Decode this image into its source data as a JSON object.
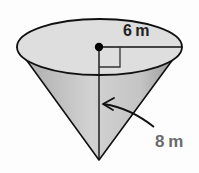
{
  "diagram": {
    "type": "cone",
    "labels": {
      "radius": "6 m",
      "height": "8 m"
    },
    "colors": {
      "top_face": "#dcdcdc",
      "side_light": "#cfcfcf",
      "side_dark": "#9a9a9a",
      "stroke": "#111111",
      "height_label": "#6b6b6b"
    },
    "right_angle_marker": true
  }
}
